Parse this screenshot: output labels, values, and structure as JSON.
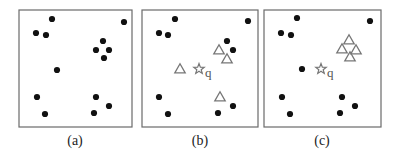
{
  "figure": {
    "panels": [
      {
        "id": "a",
        "caption": "(a)",
        "frame": {
          "x": 19,
          "y": 10,
          "w": 113,
          "h": 117
        },
        "caption_pos": {
          "x": 75,
          "y": 145
        },
        "points": [
          [
            52,
            19
          ],
          [
            124,
            22
          ],
          [
            36,
            33
          ],
          [
            46,
            35
          ],
          [
            103,
            41
          ],
          [
            96,
            50
          ],
          [
            109,
            50
          ],
          [
            104,
            58
          ],
          [
            57,
            70
          ],
          [
            37,
            97
          ],
          [
            96,
            97
          ],
          [
            109,
            106
          ],
          [
            45,
            114
          ],
          [
            94,
            113
          ]
        ],
        "triangles": [],
        "query": null
      },
      {
        "id": "b",
        "caption": "(b)",
        "frame": {
          "x": 142,
          "y": 10,
          "w": 116,
          "h": 117
        },
        "caption_pos": {
          "x": 200,
          "y": 145
        },
        "points": [
          [
            175,
            19
          ],
          [
            248,
            21
          ],
          [
            159,
            33
          ],
          [
            168,
            35
          ],
          [
            227,
            41
          ],
          [
            233,
            50
          ],
          [
            159,
            97
          ],
          [
            233,
            106
          ],
          [
            168,
            114
          ],
          [
            218,
            113
          ]
        ],
        "triangles": [
          [
            219,
            50
          ],
          [
            227,
            59
          ],
          [
            180,
            69
          ],
          [
            220,
            97
          ]
        ],
        "query": {
          "x": 199,
          "y": 69,
          "label": "q"
        }
      },
      {
        "id": "c",
        "caption": "(c)",
        "frame": {
          "x": 264,
          "y": 10,
          "w": 117,
          "h": 117
        },
        "caption_pos": {
          "x": 322,
          "y": 145
        },
        "points": [
          [
            297,
            18
          ],
          [
            370,
            21
          ],
          [
            281,
            33
          ],
          [
            291,
            35
          ],
          [
            302,
            69
          ],
          [
            282,
            97
          ],
          [
            342,
            97
          ],
          [
            355,
            106
          ],
          [
            290,
            114
          ],
          [
            340,
            113
          ]
        ],
        "triangles": [
          [
            349,
            40
          ],
          [
            342,
            49
          ],
          [
            356,
            50
          ],
          [
            350,
            57
          ]
        ],
        "query": {
          "x": 321,
          "y": 69,
          "label": "q"
        }
      }
    ],
    "legend_semantics": {
      "dot": "data point",
      "triangle": "selected neighbor",
      "star": "query point q"
    },
    "colors": {
      "dot": "#111111",
      "triangle": "#777777",
      "star": "#777777",
      "frame": "#6a6a6a"
    }
  }
}
